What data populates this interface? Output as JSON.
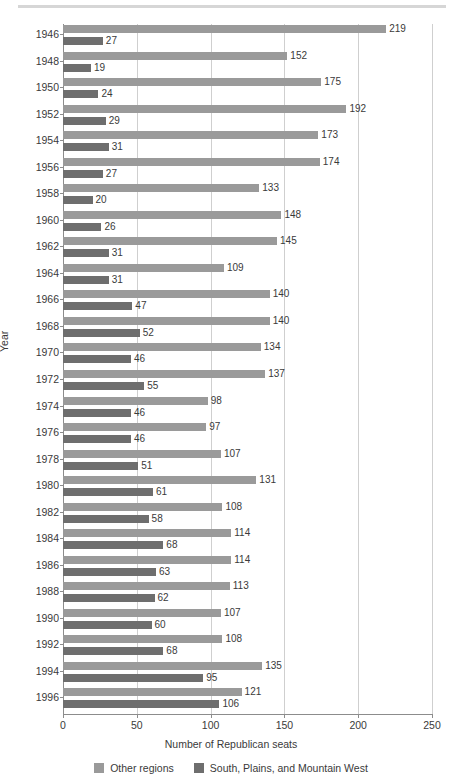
{
  "chart_data": {
    "type": "bar",
    "orientation": "horizontal",
    "title": "",
    "xlabel": "Number of Republican seats",
    "ylabel": "Year",
    "xlim": [
      0,
      250
    ],
    "xticks": [
      0,
      50,
      100,
      150,
      200,
      250
    ],
    "grid": true,
    "legend_position": "bottom",
    "categories": [
      "1946",
      "1948",
      "1950",
      "1952",
      "1954",
      "1956",
      "1958",
      "1960",
      "1962",
      "1964",
      "1966",
      "1968",
      "1970",
      "1972",
      "1974",
      "1976",
      "1978",
      "1980",
      "1982",
      "1984",
      "1986",
      "1988",
      "1990",
      "1992",
      "1994",
      "1996"
    ],
    "series": [
      {
        "name": "Other regions",
        "color": "#9a9a9a",
        "values": [
          219,
          152,
          175,
          192,
          173,
          174,
          133,
          148,
          145,
          109,
          140,
          140,
          134,
          137,
          98,
          97,
          107,
          131,
          108,
          114,
          114,
          113,
          107,
          108,
          135,
          121
        ]
      },
      {
        "name": "South, Plains, and Mountain West",
        "color": "#6e6e6e",
        "values": [
          27,
          19,
          24,
          29,
          31,
          27,
          20,
          26,
          31,
          31,
          47,
          52,
          46,
          55,
          46,
          46,
          51,
          61,
          58,
          68,
          63,
          62,
          60,
          68,
          95,
          106
        ]
      }
    ]
  },
  "legend": {
    "entries": [
      {
        "label": "Other regions",
        "color": "#9a9a9a"
      },
      {
        "label": "South, Plains, and Mountain West",
        "color": "#6e6e6e"
      }
    ]
  },
  "axes": {
    "x_title": "Number of Republican seats",
    "y_title": "Year",
    "x_tick_labels": [
      "0",
      "50",
      "100",
      "150",
      "200",
      "250"
    ]
  }
}
